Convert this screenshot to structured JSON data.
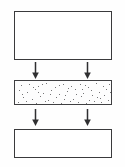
{
  "diagram": {
    "orientation": "vertical",
    "background_color": "#ffffff",
    "line_color": "#3a3a3c",
    "stages": [
      {
        "id": "stage-top",
        "label": "",
        "shape": "rectangle",
        "fill": "empty",
        "x": 14,
        "y": 11,
        "width": 98,
        "height": 49
      },
      {
        "id": "stage-middle",
        "label": "",
        "shape": "rectangle",
        "fill": "stippled",
        "stipple_color": "#4a4a4c",
        "stipple_count": 62,
        "x": 14,
        "y": 80,
        "width": 98,
        "height": 25
      },
      {
        "id": "stage-bottom",
        "label": "",
        "shape": "rectangle",
        "fill": "empty",
        "x": 14,
        "y": 129,
        "width": 98,
        "height": 29
      }
    ],
    "connectors": [
      {
        "id": "arrow-top-left",
        "direction": "down",
        "from": "stage-top",
        "to": "stage-middle",
        "x": 36,
        "y": 62
      },
      {
        "id": "arrow-top-right",
        "direction": "down",
        "from": "stage-top",
        "to": "stage-middle",
        "x": 88,
        "y": 62
      },
      {
        "id": "arrow-bottom-left",
        "direction": "down",
        "from": "stage-middle",
        "to": "stage-bottom",
        "x": 36,
        "y": 109
      },
      {
        "id": "arrow-bottom-right",
        "direction": "down",
        "from": "stage-middle",
        "to": "stage-bottom",
        "x": 88,
        "y": 109
      }
    ],
    "stipple_points": [
      [
        6,
        4
      ],
      [
        14,
        3
      ],
      [
        23,
        5
      ],
      [
        31,
        2
      ],
      [
        40,
        6
      ],
      [
        48,
        3
      ],
      [
        56,
        5
      ],
      [
        65,
        3
      ],
      [
        73,
        6
      ],
      [
        81,
        2
      ],
      [
        88,
        5
      ],
      [
        94,
        3
      ],
      [
        4,
        9
      ],
      [
        12,
        11
      ],
      [
        20,
        8
      ],
      [
        28,
        12
      ],
      [
        36,
        9
      ],
      [
        44,
        13
      ],
      [
        52,
        10
      ],
      [
        60,
        8
      ],
      [
        68,
        12
      ],
      [
        76,
        9
      ],
      [
        84,
        11
      ],
      [
        91,
        8
      ],
      [
        8,
        16
      ],
      [
        17,
        18
      ],
      [
        25,
        15
      ],
      [
        33,
        19
      ],
      [
        41,
        16
      ],
      [
        50,
        14
      ],
      [
        58,
        18
      ],
      [
        66,
        15
      ],
      [
        74,
        19
      ],
      [
        82,
        16
      ],
      [
        89,
        14
      ],
      [
        3,
        21
      ],
      [
        11,
        20
      ],
      [
        21,
        22
      ],
      [
        30,
        20
      ],
      [
        38,
        21
      ],
      [
        46,
        22
      ],
      [
        55,
        20
      ],
      [
        63,
        21
      ],
      [
        71,
        22
      ],
      [
        79,
        20
      ],
      [
        86,
        21
      ],
      [
        93,
        19
      ],
      [
        18,
        6
      ],
      [
        35,
        13
      ],
      [
        53,
        7
      ],
      [
        70,
        4
      ],
      [
        85,
        17
      ],
      [
        7,
        13
      ],
      [
        27,
        3
      ],
      [
        44,
        4
      ],
      [
        61,
        13
      ],
      [
        77,
        14
      ],
      [
        95,
        11
      ],
      [
        23,
        11
      ],
      [
        49,
        18
      ],
      [
        67,
        8
      ]
    ]
  }
}
